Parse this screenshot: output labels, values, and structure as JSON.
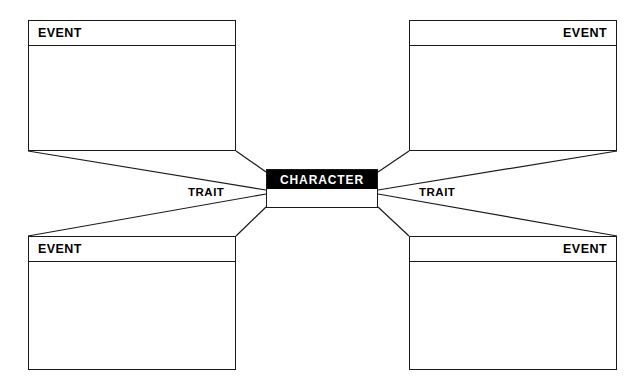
{
  "organizer": {
    "title": "Character Map Graphic Organizer",
    "background_color": "#ffffff",
    "line_color": "#1a1a1a",
    "center": {
      "label": "CHARACTER",
      "header_background": "#000000",
      "header_text_color": "#ffffff"
    },
    "traits": [
      {
        "id": "trait-left",
        "label": "TRAIT"
      },
      {
        "id": "trait-right",
        "label": "TRAIT"
      }
    ],
    "events": [
      {
        "id": "event-top-left",
        "label": "EVENT",
        "align": "left"
      },
      {
        "id": "event-top-right",
        "label": "EVENT",
        "align": "right"
      },
      {
        "id": "event-bottom-left",
        "label": "EVENT",
        "align": "left"
      },
      {
        "id": "event-bottom-right",
        "label": "EVENT",
        "align": "right"
      }
    ]
  }
}
